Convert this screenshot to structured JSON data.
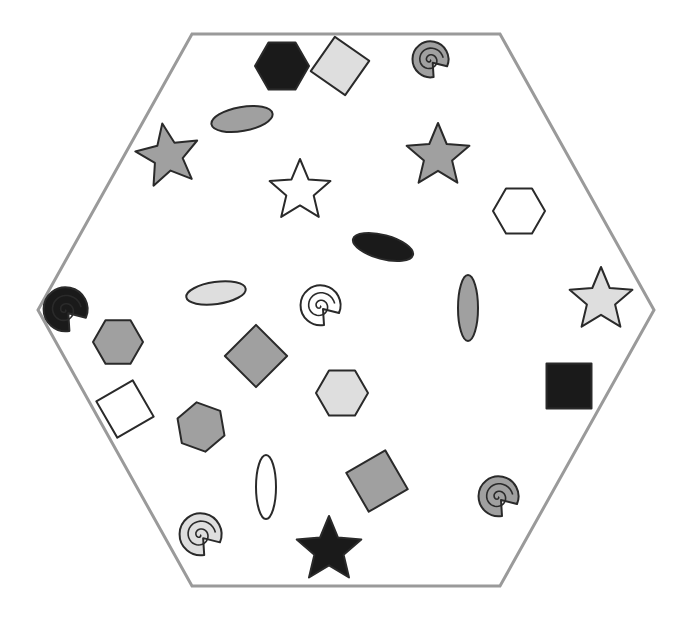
{
  "diagram": {
    "colors": {
      "black": "#1a1a1a",
      "gray": "#a0a0a0",
      "light": "#dedede",
      "white": "#ffffff",
      "stroke": "#2a2a2a",
      "border": "#9a9a9a"
    },
    "hexagon": {
      "points": [
        [
          192,
          34
        ],
        [
          500,
          34
        ],
        [
          654,
          310
        ],
        [
          500,
          586
        ],
        [
          192,
          586
        ],
        [
          38,
          310
        ]
      ],
      "stroke_width": 3
    },
    "shapes": [
      {
        "type": "hexagon",
        "cx": 282,
        "cy": 66,
        "r": 27,
        "rot": 0,
        "fill": "black"
      },
      {
        "type": "square",
        "cx": 340,
        "cy": 66,
        "s": 42,
        "rot": 35,
        "fill": "light"
      },
      {
        "type": "spiral",
        "cx": 430,
        "cy": 60,
        "r": 18,
        "rot": 0,
        "fill": "gray"
      },
      {
        "type": "ellipse",
        "cx": 242,
        "cy": 119,
        "rx": 31,
        "ry": 12,
        "rot": -10,
        "fill": "gray"
      },
      {
        "type": "star",
        "cx": 168,
        "cy": 156,
        "r": 33,
        "rot": -10,
        "fill": "gray"
      },
      {
        "type": "star",
        "cx": 300,
        "cy": 191,
        "r": 32,
        "rot": 0,
        "fill": "white"
      },
      {
        "type": "star",
        "cx": 438,
        "cy": 156,
        "r": 33,
        "rot": 0,
        "fill": "gray"
      },
      {
        "type": "hexagon",
        "cx": 519,
        "cy": 211,
        "r": 26,
        "rot": 0,
        "fill": "white"
      },
      {
        "type": "ellipse",
        "cx": 383,
        "cy": 247,
        "rx": 31,
        "ry": 12,
        "rot": 15,
        "fill": "black"
      },
      {
        "type": "ellipse",
        "cx": 216,
        "cy": 293,
        "rx": 30,
        "ry": 11,
        "rot": -8,
        "fill": "light"
      },
      {
        "type": "spiral",
        "cx": 320,
        "cy": 306,
        "r": 20,
        "rot": 0,
        "fill": "white"
      },
      {
        "type": "ellipse",
        "cx": 468,
        "cy": 308,
        "rx": 10,
        "ry": 33,
        "rot": 0,
        "fill": "gray"
      },
      {
        "type": "star",
        "cx": 601,
        "cy": 300,
        "r": 33,
        "rot": 0,
        "fill": "light"
      },
      {
        "type": "spiral",
        "cx": 65,
        "cy": 310,
        "r": 22,
        "rot": 0,
        "fill": "black"
      },
      {
        "type": "hexagon",
        "cx": 118,
        "cy": 342,
        "r": 25,
        "rot": 0,
        "fill": "gray"
      },
      {
        "type": "square",
        "cx": 256,
        "cy": 356,
        "s": 44,
        "rot": 45,
        "fill": "gray"
      },
      {
        "type": "hexagon",
        "cx": 342,
        "cy": 393,
        "r": 26,
        "rot": 0,
        "fill": "light"
      },
      {
        "type": "square",
        "cx": 569,
        "cy": 386,
        "s": 45,
        "rot": 0,
        "fill": "black"
      },
      {
        "type": "square",
        "cx": 125,
        "cy": 409,
        "s": 42,
        "rot": -30,
        "fill": "white"
      },
      {
        "type": "hexagon",
        "cx": 201,
        "cy": 427,
        "r": 25,
        "rot": 20,
        "fill": "gray"
      },
      {
        "type": "ellipse",
        "cx": 266,
        "cy": 487,
        "rx": 10,
        "ry": 32,
        "rot": 0,
        "fill": "white"
      },
      {
        "type": "square",
        "cx": 377,
        "cy": 481,
        "s": 45,
        "rot": -30,
        "fill": "gray"
      },
      {
        "type": "spiral",
        "cx": 498,
        "cy": 497,
        "r": 20,
        "rot": 0,
        "fill": "gray"
      },
      {
        "type": "spiral",
        "cx": 200,
        "cy": 535,
        "r": 21,
        "rot": 0,
        "fill": "light"
      },
      {
        "type": "star",
        "cx": 329,
        "cy": 550,
        "r": 34,
        "rot": 0,
        "fill": "black"
      }
    ]
  }
}
